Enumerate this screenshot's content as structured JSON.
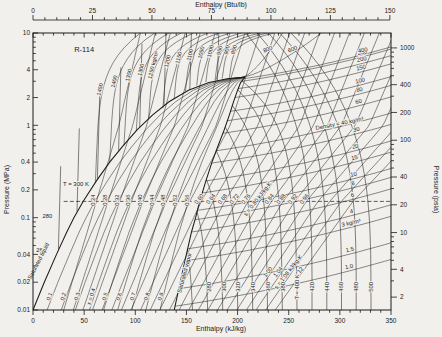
{
  "chart_data": {
    "type": "line",
    "title": "R-114",
    "axes": {
      "top": {
        "label": "Enthalpy (Btu/lb)",
        "ticks": [
          0,
          25,
          50,
          75,
          100,
          125,
          150
        ],
        "minor_step": 5,
        "kjkg_per_btulb": 2.326
      },
      "bottom": {
        "label": "Enthalpy (kJ/kg)",
        "ticks": [
          0,
          50,
          100,
          150,
          200,
          250,
          300,
          350
        ],
        "minor_step": 10,
        "range": [
          0,
          350
        ]
      },
      "left": {
        "label": "Pressure (MPa)",
        "scale": "log",
        "range": [
          0.01,
          10
        ],
        "ticks": [
          10,
          4,
          2,
          1,
          0.4,
          0.2,
          0.1,
          0.04,
          0.02,
          0.01
        ]
      },
      "right": {
        "label": "Pressure (psia)",
        "scale": "log",
        "ticks": [
          1000,
          400,
          200,
          100,
          40,
          20,
          10,
          4,
          2
        ],
        "mpa_per_psia": 0.0068948
      }
    },
    "saturation_dome": {
      "pressure_mpa": [
        0.01,
        0.02,
        0.04,
        0.07,
        0.1,
        0.15,
        0.25,
        0.4,
        0.6,
        0.9,
        1.3,
        1.8,
        2.4,
        2.9,
        3.2,
        3.33
      ],
      "temperature_k": [
        233,
        245,
        258,
        269,
        277,
        286,
        299,
        312,
        324,
        338,
        351,
        364,
        379,
        394,
        407,
        418
      ],
      "h_liquid": [
        0,
        11,
        23,
        33,
        40,
        49,
        62,
        75,
        88,
        102,
        117,
        133,
        152,
        172,
        190,
        207
      ],
      "h_vapor": [
        138,
        144,
        150,
        155,
        159,
        163,
        169,
        175,
        181,
        187,
        192,
        196,
        200,
        203,
        206,
        207
      ],
      "labels": {
        "liquid": "Saturated liquid",
        "vapor": "Saturated vapor"
      }
    },
    "isotherms_k": {
      "values": [
        260,
        280,
        300,
        320,
        340,
        360,
        380,
        400,
        420,
        440,
        460,
        480,
        500
      ],
      "main_label": "T = 400 K",
      "liquid_side_label": "T = 300 K",
      "liquid_side_minor_labels": [
        "260",
        "280"
      ]
    },
    "isentropes_kj_per_kgk": {
      "values": [
        0.24,
        0.28,
        0.32,
        0.36,
        0.4,
        0.44,
        0.48,
        0.52,
        0.56,
        0.6,
        0.64,
        0.68,
        0.72,
        0.76,
        0.8,
        0.84,
        0.88,
        0.92,
        0.96,
        1.0,
        1.04,
        1.08,
        1.12
      ],
      "main_label": "s = 0.80 kJ/kg·K",
      "secondary_label": "s = 1.08 kJ/kg·K"
    },
    "isochores_kg_m3": {
      "main_label": "Density = 40 kg/m³",
      "vapor": [
        {
          "rho": 1.0,
          "p": 0.011,
          "label": "1.0"
        },
        {
          "rho": 1.5,
          "p": 0.017,
          "label": "1.5"
        },
        {
          "rho": 3,
          "p": 0.034,
          "label": "3 kg/m³"
        },
        {
          "rho": 4,
          "p": 0.046,
          "label": "4"
        },
        {
          "rho": 6,
          "p": 0.07,
          "label": "6"
        },
        {
          "rho": 8,
          "p": 0.095,
          "label": "8"
        },
        {
          "rho": 10,
          "p": 0.12,
          "label": "10"
        },
        {
          "rho": 15,
          "p": 0.185,
          "label": "15"
        },
        {
          "rho": 20,
          "p": 0.25,
          "label": "20"
        },
        {
          "rho": 30,
          "p": 0.39,
          "label": "30"
        },
        {
          "rho": 40,
          "p": 0.53,
          "label": ""
        },
        {
          "rho": 60,
          "p": 0.82,
          "label": "60"
        },
        {
          "rho": 80,
          "p": 1.12,
          "label": "80"
        },
        {
          "rho": 100,
          "p": 1.42,
          "label": "100"
        },
        {
          "rho": 150,
          "p": 2.0,
          "label": "150"
        },
        {
          "rho": 200,
          "p": 2.5,
          "label": "200"
        },
        {
          "rho": 300,
          "p": 3.0,
          "label": "300"
        },
        {
          "rho": 400,
          "p": 3.2,
          "label": "400"
        }
      ],
      "supercritical": [
        {
          "rho": 600,
          "h_top": 282,
          "label": "600"
        },
        {
          "rho": 800,
          "h_top": 244,
          "label": "800"
        }
      ],
      "liquid": [
        {
          "rho": 850,
          "p": 3.26,
          "h": 192,
          "label": "850"
        },
        {
          "rho": 900,
          "p": 3.2,
          "h": 185,
          "label": "900"
        },
        {
          "rho": 950,
          "p": 3.1,
          "h": 178,
          "label": "950"
        },
        {
          "rho": 1000,
          "p": 2.95,
          "h": 169,
          "label": "1000"
        },
        {
          "rho": 1050,
          "p": 2.7,
          "h": 160,
          "label": "1050"
        },
        {
          "rho": 1100,
          "p": 2.33,
          "h": 149,
          "label": "1100"
        },
        {
          "rho": 1150,
          "p": 1.93,
          "h": 138,
          "label": "1150"
        },
        {
          "rho": 1200,
          "p": 1.53,
          "h": 127,
          "label": "1200"
        },
        {
          "rho": 1250,
          "p": 1.18,
          "h": 113,
          "label": "1250 kg/m³"
        },
        {
          "rho": 1300,
          "p": 0.87,
          "h": 101,
          "label": "1300"
        },
        {
          "rho": 1350,
          "p": 0.61,
          "h": 89,
          "label": "1350"
        },
        {
          "rho": 1400,
          "p": 0.4,
          "h": 75,
          "label": "1400"
        },
        {
          "rho": 1450,
          "p": 0.24,
          "h": 61,
          "label": "1450"
        }
      ]
    },
    "quality_lines": {
      "values": [
        0.1,
        0.2,
        0.3,
        0.4,
        0.5,
        0.6,
        0.7,
        0.8,
        0.9
      ],
      "prefixed_value": 0.4,
      "prefixed_label": "x = 0.4"
    },
    "reference_line": {
      "pressure_mpa": 0.15,
      "style": "dashed"
    },
    "annotations": [
      {
        "text": "R-114",
        "h": 50,
        "p": 6.2,
        "size": 7.5,
        "rot": 0
      },
      {
        "text": "T = 300 K",
        "h": 42,
        "p": 0.22,
        "size": 6,
        "rot": 0
      },
      {
        "text": "280",
        "h": 14,
        "p": 0.1,
        "size": 5.8,
        "rot": 0
      },
      {
        "text": "260",
        "h": 8,
        "p": 0.042,
        "size": 5.8,
        "rot": 0
      },
      {
        "text": "Saturated liquid",
        "h": 7,
        "p": 0.033,
        "size": 5.8,
        "rot": -63
      },
      {
        "text": "Saturated vapor",
        "h": 150,
        "p": 0.025,
        "size": 5.8,
        "rot": -75
      },
      {
        "text": "Density = 40 kg/m³",
        "h": 300,
        "p": 1.0,
        "size": 5.8,
        "rot": -11
      }
    ]
  },
  "model": {
    "isentrope": {
      "lp_ref": -0.824,
      "h_bot": 30,
      "T_bot": 235,
      "h_ref": 62,
      "T_ref": 285,
      "h_mid": 84,
      "T_mid": 340,
      "h_top": 105,
      "T_top": 365
    },
    "isotherm": {
      "h_inf_base": 172,
      "h_inf_slope": 0.72,
      "T_base": 280,
      "h_top_crit": 207,
      "h_top_slope": 0.55,
      "T_crit": 418
    },
    "isochore": {
      "slope": 0.0016,
      "curve": 0.5,
      "liq_lean": 6,
      "liq_bend": 38
    }
  }
}
